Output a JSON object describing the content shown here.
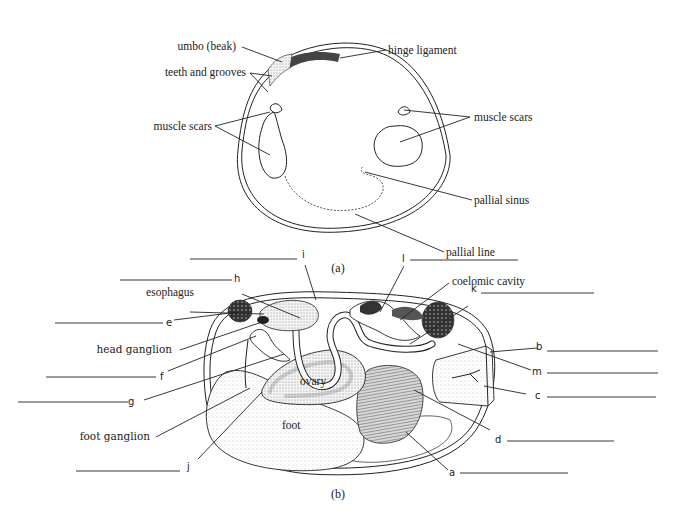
{
  "figure_a": {
    "caption": "(a)",
    "labels": {
      "umbo": "umbo (beak)",
      "teeth": "teeth and grooves",
      "hinge": "hinge ligament",
      "muscle_scars_left": "muscle scars",
      "muscle_scars_right": "muscle scars",
      "pallial_sinus": "pallial sinus",
      "pallial_line": "pallial line"
    }
  },
  "figure_b": {
    "caption": "(b)",
    "named_labels": {
      "esophagus": "esophagus",
      "coelomic_cavity": "coelomic cavity",
      "head_ganglion": "head ganglion",
      "foot_ganglion": "foot ganglion",
      "ovary": "ovary",
      "foot": "foot"
    },
    "letter_labels": {
      "a": "a",
      "b": "b",
      "c": "c",
      "d": "d",
      "e": "e",
      "f": "f",
      "g": "g",
      "h": "h",
      "i": "i",
      "j": "j",
      "k": "k",
      "l": "l",
      "m": "m"
    }
  },
  "colors": {
    "ink": "#222222",
    "dark_fill": "#3a3a3a",
    "stipple": "#bdbdbd",
    "background": "#ffffff"
  }
}
